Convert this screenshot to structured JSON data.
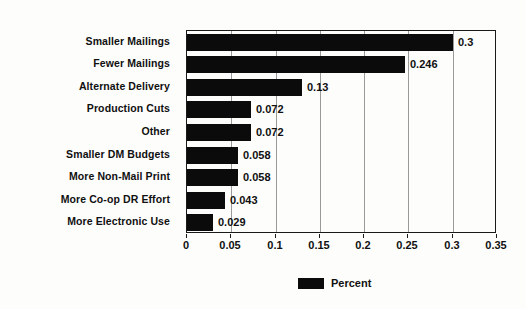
{
  "chart_data": {
    "type": "bar",
    "orientation": "horizontal",
    "title": "",
    "xlabel": "",
    "ylabel": "",
    "categories": [
      "Smaller Mailings",
      "Fewer Mailings",
      "Alternate Delivery",
      "Production Cuts",
      "Other",
      "Smaller DM Budgets",
      "More Non-Mail Print",
      "More Co-op DR Effort",
      "More Electronic Use"
    ],
    "values": [
      0.3,
      0.246,
      0.13,
      0.072,
      0.072,
      0.058,
      0.058,
      0.043,
      0.029
    ],
    "data_labels": [
      "0.3",
      "0.246",
      "0.13",
      "0.072",
      "0.072",
      "0.058",
      "0.058",
      "0.043",
      "0.029"
    ],
    "series": [
      {
        "name": "Percent",
        "color": "#0b0b0b",
        "values": [
          0.3,
          0.246,
          0.13,
          0.072,
          0.072,
          0.058,
          0.058,
          0.043,
          0.029
        ]
      }
    ],
    "xlim": [
      0,
      0.35
    ],
    "xticks": [
      0,
      0.05,
      0.1,
      0.15,
      0.2,
      0.25,
      0.3,
      0.35
    ],
    "xtick_labels": [
      "0",
      "0.05",
      "0.1",
      "0.15",
      "0.2",
      "0.25",
      "0.3",
      "0.35"
    ],
    "grid": "vertical",
    "legend": {
      "position": "bottom-center",
      "entries": [
        {
          "label": "Percent",
          "color": "#0b0b0b"
        }
      ]
    },
    "background_color": "#fdfdfc",
    "axis_color": "#1a1a1a",
    "gridline_color": "#9a9a9a"
  }
}
